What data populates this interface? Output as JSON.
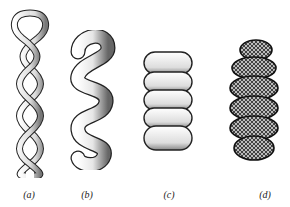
{
  "figure": {
    "panels": [
      {
        "id": "a",
        "label": "(a)",
        "description": "two-strand twisted rope, thin strands"
      },
      {
        "id": "b",
        "label": "(b)",
        "description": "thicker twisted coil"
      },
      {
        "id": "c",
        "label": "(c)",
        "description": "tightly wound solenoid coil"
      },
      {
        "id": "d",
        "label": "(d)",
        "description": "supercoiled textured fibre"
      }
    ]
  }
}
